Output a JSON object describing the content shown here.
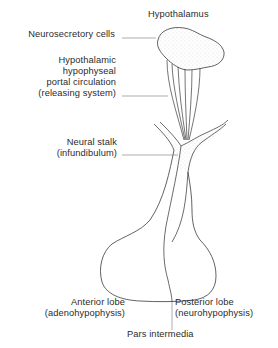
{
  "diagram": {
    "colors": {
      "line": "#3a3a3a",
      "leader": "#777777",
      "stipple": "#c8c8c8",
      "background": "#ffffff"
    },
    "labels": {
      "hypothalamus": "Hypothalamus",
      "neurosecretory": "Neurosecretory cells",
      "portal": {
        "line1": "Hypothalamic",
        "line2": "hypophyseal",
        "line3": "portal circulation",
        "line4": "(releasing system)"
      },
      "stalk": {
        "line1": "Neural stalk",
        "line2": "(infundibulum)"
      },
      "anterior": {
        "line1": "Anterior lobe",
        "line2": "(adenohypophysis)"
      },
      "posterior": {
        "line1": "Posterior lobe",
        "line2": "(neurohypophysis)"
      },
      "intermedia": "Pars intermedia"
    }
  }
}
